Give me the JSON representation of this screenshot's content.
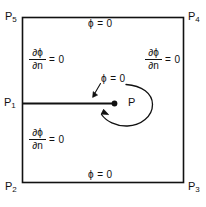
{
  "figure": {
    "domain_shape": "square",
    "stroke_color": "#111111",
    "background_color": "#ffffff",
    "corners": [
      {
        "id": "p5",
        "base": "P",
        "sub": "5",
        "position": "top-left"
      },
      {
        "id": "p4",
        "base": "P",
        "sub": "4",
        "position": "top-right"
      },
      {
        "id": "p2",
        "base": "P",
        "sub": "2",
        "position": "bottom-left"
      },
      {
        "id": "p3",
        "base": "P",
        "sub": "3",
        "position": "bottom-right"
      },
      {
        "id": "p1",
        "base": "P",
        "sub": "1",
        "position": "left-middle"
      }
    ],
    "boundary_conditions": {
      "top": {
        "text": "ϕ = 0",
        "type": "dirichlet"
      },
      "bottom": {
        "text": "ϕ = 0",
        "type": "dirichlet"
      },
      "left_upper": {
        "numerator": "∂ϕ",
        "denominator": "∂n",
        "equals": "= 0",
        "type": "neumann"
      },
      "left_lower": {
        "numerator": "∂ϕ",
        "denominator": "∂n",
        "equals": "= 0",
        "type": "neumann"
      },
      "right": {
        "numerator": "∂ϕ",
        "denominator": "∂n",
        "equals": "= 0",
        "type": "neumann"
      }
    },
    "slit": {
      "tip_label": "P",
      "condition_text": "ϕ = 0",
      "description": "horizontal slit from left edge at P1 to interior tip point P"
    }
  }
}
